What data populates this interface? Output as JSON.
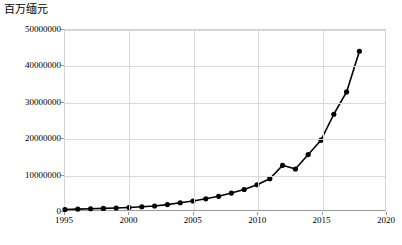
{
  "chart_data": {
    "type": "line",
    "title": "",
    "ylabel": "百万缅元",
    "xlabel": "",
    "ylim": [
      0,
      50000000
    ],
    "xlim": [
      1995,
      2020
    ],
    "grid": true,
    "legend": "none",
    "marker": "filled-circle",
    "line_color": "#000000",
    "marker_color": "#000000",
    "y_ticks": [
      0,
      10000000,
      20000000,
      30000000,
      40000000,
      50000000
    ],
    "y_tick_labels": [
      "0",
      "10000000",
      "20000000",
      "30000000",
      "40000000",
      "50000000"
    ],
    "x_ticks": [
      1995,
      2000,
      2005,
      2010,
      2015,
      2020
    ],
    "x_tick_labels": [
      "1995",
      "2000",
      "2005",
      "2010",
      "2015",
      "2020"
    ],
    "x": [
      1995,
      1996,
      1997,
      1998,
      1999,
      2000,
      2001,
      2002,
      2003,
      2004,
      2005,
      2006,
      2007,
      2008,
      2009,
      2010,
      2011,
      2012,
      2013,
      2014,
      2015,
      2016,
      2017,
      2018
    ],
    "values": [
      150000,
      250000,
      350000,
      450000,
      550000,
      700000,
      900000,
      1100000,
      1500000,
      2000000,
      2500000,
      3100000,
      3800000,
      4700000,
      5700000,
      7000000,
      8700000,
      12400000,
      11400000,
      15400000,
      19400000,
      26600000,
      32800000,
      44100000
    ],
    "series": [
      {
        "name": "百万缅元",
        "values": [
          150000,
          250000,
          350000,
          450000,
          550000,
          700000,
          900000,
          1100000,
          1500000,
          2000000,
          2500000,
          3100000,
          3800000,
          4700000,
          5700000,
          7000000,
          8700000,
          12400000,
          11400000,
          15400000,
          19400000,
          26600000,
          32800000,
          44100000
        ]
      }
    ]
  }
}
